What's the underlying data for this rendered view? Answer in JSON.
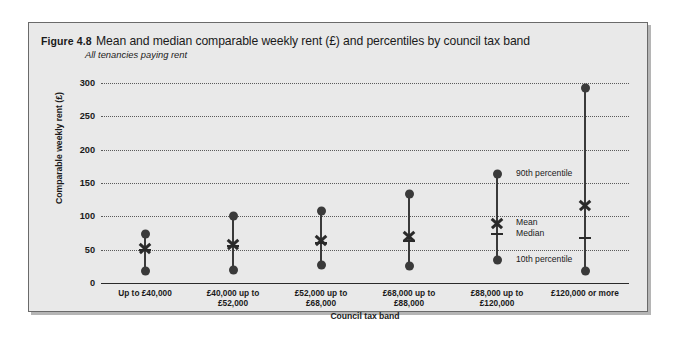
{
  "figure": {
    "number": "Figure 4.8",
    "title": "Mean and median comparable weekly rent (£) and percentiles by council tax band",
    "subtitle": "All tenancies paying rent"
  },
  "chart_data": {
    "type": "line",
    "title": "Mean and median comparable weekly rent (£) and percentiles by council tax band",
    "subtitle": "All tenancies paying rent",
    "xlabel": "Council tax band",
    "ylabel": "Comparable weekly rent (£)",
    "ylim": [
      0,
      300
    ],
    "yticks": [
      0,
      50,
      100,
      150,
      200,
      250,
      300
    ],
    "ytick_labels": [
      "0",
      "50",
      "100",
      "150",
      "200",
      "250",
      "300"
    ],
    "grid": true,
    "legend_position": "inside-right",
    "categories": [
      "Up to £40,000",
      "£40,000 up to £52,000",
      "£52,000 up to £68,000",
      "£68,000 up to £88,000",
      "£88,000 up to £120,000",
      "£120,000 or more"
    ],
    "category_lines": [
      [
        "Up to £40,000"
      ],
      [
        "£40,000  up to",
        "£52,000"
      ],
      [
        "£52,000  up to",
        "£68,000"
      ],
      [
        "£68,000  up to",
        "£88,000"
      ],
      [
        "£88,000  up to",
        "£120,000"
      ],
      [
        "£120,000 or more"
      ]
    ],
    "series": [
      {
        "name": "90th percentile",
        "values": [
          74,
          100,
          108,
          133,
          163,
          292
        ]
      },
      {
        "name": "Mean",
        "values": [
          52,
          58,
          64,
          70,
          90,
          117
        ]
      },
      {
        "name": "Median",
        "values": [
          50,
          55,
          60,
          63,
          73,
          68
        ]
      },
      {
        "name": "10th percentile",
        "values": [
          18,
          19,
          27,
          25,
          34,
          18
        ]
      }
    ],
    "legend": [
      "90th percentile",
      "Mean",
      "Median",
      "10th percentile"
    ],
    "annotations": [
      {
        "label": "90th percentile",
        "value": 163
      },
      {
        "label": "Mean",
        "value": 90
      },
      {
        "label": "Median",
        "value": 73
      },
      {
        "label": "10th percentile",
        "value": 34
      }
    ],
    "colors": {
      "marker": "#3a3a3a",
      "grid": "#5a5a5a",
      "panel": "#e9e9e9"
    }
  }
}
